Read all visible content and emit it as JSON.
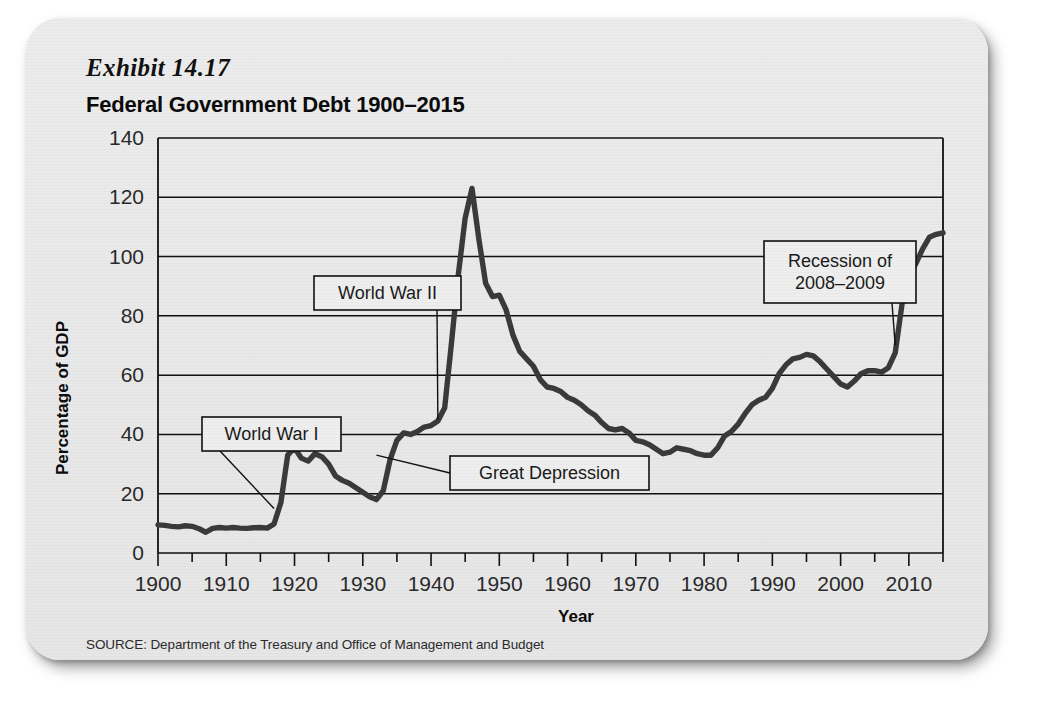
{
  "card": {
    "exhibit_label": "Exhibit 14.17",
    "title": "Federal Government Debt 1900–2015",
    "source": "SOURCE: Department of the Treasury and Office of Management and Budget"
  },
  "chart_data": {
    "type": "line",
    "title": "Federal Government Debt 1900–2015",
    "xlabel": "Year",
    "ylabel": "Percentage of GDP",
    "xlim": [
      1900,
      2015
    ],
    "ylim": [
      0,
      140
    ],
    "ytick_step": 20,
    "xtick_step": 10,
    "x_minor_step": 5,
    "grid": true,
    "legend": "none",
    "line_color": "#3a3a3a",
    "xticks": [
      1900,
      1910,
      1920,
      1930,
      1940,
      1950,
      1960,
      1970,
      1980,
      1990,
      2000,
      2010
    ],
    "yticks": [
      0,
      20,
      40,
      60,
      80,
      100,
      120,
      140
    ],
    "x": [
      1900,
      1901,
      1902,
      1903,
      1904,
      1905,
      1906,
      1907,
      1908,
      1909,
      1910,
      1911,
      1912,
      1913,
      1914,
      1915,
      1916,
      1917,
      1918,
      1919,
      1920,
      1921,
      1922,
      1923,
      1924,
      1925,
      1926,
      1927,
      1928,
      1929,
      1930,
      1931,
      1932,
      1933,
      1934,
      1935,
      1936,
      1937,
      1938,
      1939,
      1940,
      1941,
      1942,
      1943,
      1944,
      1945,
      1946,
      1947,
      1948,
      1949,
      1950,
      1951,
      1952,
      1953,
      1954,
      1955,
      1956,
      1957,
      1958,
      1959,
      1960,
      1961,
      1962,
      1963,
      1964,
      1965,
      1966,
      1967,
      1968,
      1969,
      1970,
      1971,
      1972,
      1973,
      1974,
      1975,
      1976,
      1977,
      1978,
      1979,
      1980,
      1981,
      1982,
      1983,
      1984,
      1985,
      1986,
      1987,
      1988,
      1989,
      1990,
      1991,
      1992,
      1993,
      1994,
      1995,
      1996,
      1997,
      1998,
      1999,
      2000,
      2001,
      2002,
      2003,
      2004,
      2005,
      2006,
      2007,
      2008,
      2009,
      2010,
      2011,
      2012,
      2013,
      2014,
      2015
    ],
    "values": [
      9.5,
      9.3,
      9.0,
      8.8,
      9.2,
      9.0,
      8.2,
      7.0,
      8.3,
      8.6,
      8.4,
      8.6,
      8.4,
      8.3,
      8.5,
      8.6,
      8.4,
      9.8,
      17.0,
      33.0,
      35.5,
      32.0,
      31.0,
      33.5,
      32.5,
      30.0,
      26.0,
      24.5,
      23.5,
      22.0,
      20.5,
      19.0,
      18.0,
      21.0,
      31.5,
      38.0,
      40.5,
      40.0,
      41.0,
      42.5,
      43.0,
      44.5,
      49.0,
      71.0,
      94.0,
      113.0,
      123.0,
      106.0,
      91.0,
      86.5,
      87.0,
      82.0,
      73.5,
      68.0,
      65.5,
      63.0,
      58.5,
      56.0,
      55.5,
      54.5,
      52.5,
      51.5,
      50.0,
      48.0,
      46.5,
      44.0,
      42.0,
      41.5,
      42.0,
      40.5,
      38.0,
      37.5,
      36.5,
      35.0,
      33.5,
      34.0,
      35.5,
      35.0,
      34.5,
      33.5,
      33.0,
      33.0,
      35.5,
      39.5,
      41.0,
      43.5,
      47.0,
      50.0,
      51.5,
      52.5,
      55.5,
      60.5,
      63.5,
      65.5,
      66.0,
      67.0,
      66.5,
      64.5,
      62.0,
      59.5,
      57.0,
      56.0,
      58.0,
      60.5,
      61.5,
      61.5,
      61.0,
      62.5,
      67.5,
      84.0,
      93.5,
      97.5,
      102.5,
      106.5,
      107.5,
      108.0
    ],
    "annotations": [
      {
        "id": "world-war-i",
        "label": "World War I",
        "lines": [
          "World War I"
        ],
        "target_year": 1917,
        "target_value": 15
      },
      {
        "id": "world-war-ii",
        "label": "World War II",
        "lines": [
          "World War II"
        ],
        "target_year": 1941,
        "target_value": 45
      },
      {
        "id": "great-depression",
        "label": "Great Depression",
        "lines": [
          "Great Depression"
        ],
        "target_year": 1932,
        "target_value": 33
      },
      {
        "id": "recession-2008",
        "label": "Recession of 2008–2009",
        "lines": [
          "Recession of",
          "2008–2009"
        ],
        "target_year": 2008,
        "target_value": 70
      }
    ]
  }
}
